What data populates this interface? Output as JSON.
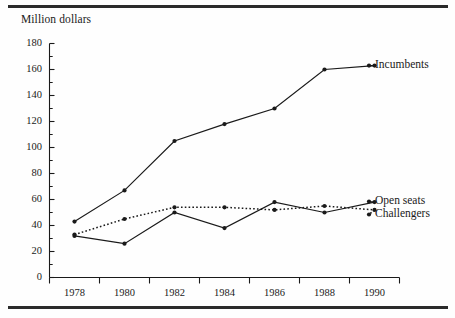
{
  "figure": {
    "axis_title": "Million dollars",
    "frame_color": "#2b2b2b",
    "line_color": "#1a1a1a",
    "background": "#fefefe"
  },
  "chart_data": {
    "type": "line",
    "title": "",
    "subtitle": "",
    "xlabel": "",
    "ylabel": "Million dollars",
    "x": [
      1978,
      1980,
      1982,
      1984,
      1986,
      1988,
      1990
    ],
    "categories": [
      "1978",
      "1980",
      "1982",
      "1984",
      "1986",
      "1988",
      "1990"
    ],
    "xtick_labels": [
      "1978",
      "1980",
      "1982",
      "1984",
      "1986",
      "1988",
      "1990"
    ],
    "ytick_labels": [
      "0",
      "20",
      "40",
      "60",
      "80",
      "100",
      "120",
      "140",
      "160",
      "180"
    ],
    "yticks": [
      0,
      20,
      40,
      60,
      80,
      100,
      120,
      140,
      160,
      180
    ],
    "yminor_step": 10,
    "ylim": [
      0,
      180
    ],
    "grid": false,
    "legend_position": "right-inline",
    "series": [
      {
        "name": "Incumbents",
        "style": "solid",
        "marker": "dot",
        "values": [
          43,
          67,
          105,
          118,
          130,
          160,
          163
        ]
      },
      {
        "name": "Open seats",
        "style": "solid",
        "marker": "dot",
        "values": [
          32,
          26,
          50,
          38,
          58,
          50,
          58
        ]
      },
      {
        "name": "Challengers",
        "style": "dotted",
        "marker": "dot",
        "values": [
          33,
          45,
          54,
          54,
          52,
          55,
          52
        ]
      }
    ]
  },
  "labels": {
    "incumbents": "Incumbents",
    "open_seats": "Open seats",
    "challengers": "Challengers"
  }
}
